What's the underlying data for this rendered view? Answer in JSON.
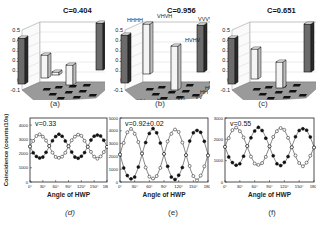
{
  "chart_data": [
    {
      "panel": "(a)",
      "type": "bar3d",
      "title": "C=0.404",
      "zlim": [
        -0.1,
        0.5
      ],
      "zticks": [
        "0.5",
        "0.4",
        "0.3",
        "0.2",
        "0.1",
        "0",
        "-0.1"
      ],
      "basis": [
        "HH",
        "HV",
        "VH",
        "VV"
      ],
      "bars": [
        {
          "row": "HH",
          "col": "HH",
          "value": 0.46,
          "shade": "dark"
        },
        {
          "row": "HV",
          "col": "HV",
          "value": 0.23,
          "shade": "light"
        },
        {
          "row": "VH",
          "col": "VH",
          "value": 0.2,
          "shade": "light"
        },
        {
          "row": "VV",
          "col": "VV",
          "value": 0.47,
          "shade": "dark"
        },
        {
          "row": "HV",
          "col": "VH",
          "value": 0.03,
          "shade": "light"
        }
      ]
    },
    {
      "panel": "(b)",
      "type": "bar3d",
      "title": "C=0.956",
      "zlim": [
        -0.1,
        0.5
      ],
      "zticks": [
        "0.5",
        "0.4",
        "0.3",
        "0.2",
        "0.1",
        "0",
        "-0.1"
      ],
      "basis": [
        "HH",
        "HV",
        "VH",
        "VV"
      ],
      "axis_labels_front": [
        "HH",
        "HV",
        "VH",
        "VV"
      ],
      "axis_labels_side": [
        "VV",
        "VH",
        "HV",
        "HH"
      ],
      "bar_labels": [
        "HHHH",
        "VHVH",
        "HVHV",
        "VVVV"
      ],
      "bars": [
        {
          "row": "HH",
          "col": "HH",
          "value": 0.48,
          "shade": "dark"
        },
        {
          "row": "HV",
          "col": "HV",
          "value": 0.5,
          "shade": "light"
        },
        {
          "row": "VH",
          "col": "VH",
          "value": 0.44,
          "shade": "light"
        },
        {
          "row": "VV",
          "col": "VV",
          "value": 0.47,
          "shade": "dark"
        }
      ]
    },
    {
      "panel": "(c)",
      "type": "bar3d",
      "title": "C=0.651",
      "zlim": [
        -0.1,
        0.5
      ],
      "zticks": [
        "0.5",
        "0.4",
        "0.3",
        "0.2",
        "0.1",
        "0",
        "-0.1"
      ],
      "basis": [
        "HH",
        "HV",
        "VH",
        "VV"
      ],
      "bars": [
        {
          "row": "HH",
          "col": "HH",
          "value": 0.46,
          "shade": "dark"
        },
        {
          "row": "HV",
          "col": "HV",
          "value": 0.3,
          "shade": "light"
        },
        {
          "row": "VH",
          "col": "VH",
          "value": 0.26,
          "shade": "light"
        },
        {
          "row": "VV",
          "col": "VV",
          "value": 0.48,
          "shade": "dark"
        }
      ]
    },
    {
      "panel": "(d)",
      "type": "line",
      "annotation": "v=0.33",
      "xlabel": "Angle of HWP",
      "ylabel": "Coincidence (counts/10s)",
      "xlim": [
        0,
        180
      ],
      "ylim": [
        0,
        4500
      ],
      "xticks": [
        "0°",
        "30°",
        "60°",
        "90°",
        "120°",
        "150°",
        "180°"
      ],
      "yticks": [
        "0",
        "1000",
        "2000",
        "3000",
        "4000"
      ],
      "series": [
        {
          "name": "filled",
          "marker": "filled-circle",
          "mean": 2500,
          "amplitude": 830,
          "period_deg": 90,
          "phase_deg": 0,
          "sign": -1
        },
        {
          "name": "open",
          "marker": "open-circle",
          "mean": 2500,
          "amplitude": 830,
          "period_deg": 90,
          "phase_deg": 0,
          "sign": 1
        }
      ]
    },
    {
      "panel": "(e)",
      "type": "line",
      "annotation": "v=0.92±0.02",
      "xlabel": "Angle of HWP",
      "xlim": [
        0,
        180
      ],
      "ylim": [
        0,
        5000
      ],
      "xticks": [
        "0°",
        "30°",
        "60°",
        "90°",
        "120°",
        "150°",
        "180°"
      ],
      "yticks": [
        "0",
        "1000",
        "2000",
        "3000",
        "4000",
        "5000"
      ],
      "series": [
        {
          "name": "filled",
          "marker": "filled-circle",
          "mean": 2150,
          "amplitude": 1950,
          "period_deg": 90,
          "phase_deg": 0,
          "sign": -1
        },
        {
          "name": "open",
          "marker": "open-circle",
          "mean": 2150,
          "amplitude": 1950,
          "period_deg": 90,
          "phase_deg": 0,
          "sign": 1
        }
      ]
    },
    {
      "panel": "(f)",
      "type": "line",
      "annotation": "v=0.55",
      "xlabel": "Angle of HWP",
      "xlim": [
        0,
        180
      ],
      "ylim": [
        0,
        3000
      ],
      "xticks": [
        "0°",
        "30°",
        "60°",
        "90°",
        "120°",
        "150°",
        "180°"
      ],
      "yticks": [
        "0",
        "1000",
        "2000",
        "3000"
      ],
      "series": [
        {
          "name": "filled",
          "marker": "filled-circle",
          "mean": 1650,
          "amplitude": 880,
          "period_deg": 90,
          "phase_deg": 0,
          "sign": -1
        },
        {
          "name": "open",
          "marker": "open-circle",
          "mean": 1650,
          "amplitude": 880,
          "period_deg": 90,
          "phase_deg": 0,
          "sign": 1
        }
      ]
    }
  ],
  "captions": {
    "a": "(a)",
    "b": "(b)",
    "c": "(c)",
    "d": "(d)",
    "e": "(e)",
    "f": "(f)"
  }
}
